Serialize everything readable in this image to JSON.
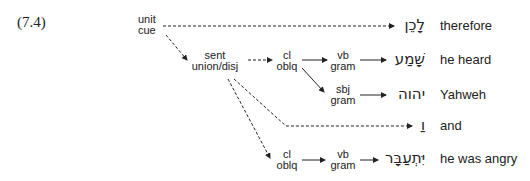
{
  "example": {
    "number": "(7.4)"
  },
  "nodes": {
    "unit_cue": {
      "line1": "unit",
      "line2": "cue"
    },
    "sent_union": {
      "line1": "sent",
      "line2": "union/disj"
    },
    "cl_oblq_1": {
      "line1": "cl",
      "line2": "oblq"
    },
    "vb_gram_1": {
      "line1": "vb",
      "line2": "gram"
    },
    "sbj_gram": {
      "line1": "sbj",
      "line2": "gram"
    },
    "cl_oblq_2": {
      "line1": "cl",
      "line2": "oblq"
    },
    "vb_gram_2": {
      "line1": "vb",
      "line2": "gram"
    }
  },
  "rows": [
    {
      "hebrew": "לָכֵן",
      "gloss": "therefore"
    },
    {
      "hebrew": "שָׁמַע",
      "gloss": "he heard"
    },
    {
      "hebrew": "יהוה",
      "gloss": "Yahweh"
    },
    {
      "hebrew": "וַ",
      "gloss": "and"
    },
    {
      "hebrew": "יִּתְעַבָּר",
      "gloss": "he was angry"
    }
  ],
  "edges": [
    {
      "from": "unit_cue",
      "to": "row0",
      "style": "dashed"
    },
    {
      "from": "unit_cue",
      "to": "sent_union",
      "style": "dashed"
    },
    {
      "from": "sent_union",
      "to": "cl_oblq_1",
      "style": "dashed"
    },
    {
      "from": "cl_oblq_1",
      "to": "vb_gram_1",
      "style": "solid"
    },
    {
      "from": "vb_gram_1",
      "to": "row1",
      "style": "solid"
    },
    {
      "from": "cl_oblq_1",
      "to": "sbj_gram",
      "style": "solid"
    },
    {
      "from": "sbj_gram",
      "to": "row2",
      "style": "solid"
    },
    {
      "from": "sent_union",
      "to": "row3",
      "style": "dashed"
    },
    {
      "from": "sent_union",
      "to": "cl_oblq_2",
      "style": "dashed"
    },
    {
      "from": "cl_oblq_2",
      "to": "vb_gram_2",
      "style": "solid"
    },
    {
      "from": "vb_gram_2",
      "to": "row4",
      "style": "solid"
    }
  ]
}
